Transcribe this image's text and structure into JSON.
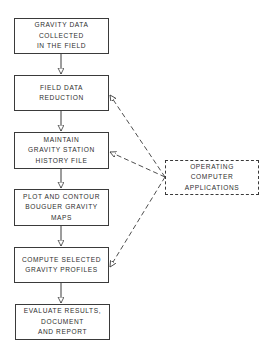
{
  "diagram": {
    "type": "flowchart",
    "steps": [
      {
        "id": "step1",
        "lines": [
          "GRAVITY DATA",
          "COLLECTED",
          "IN THE FIELD"
        ]
      },
      {
        "id": "step2",
        "lines": [
          "FIELD DATA",
          "REDUCTION"
        ]
      },
      {
        "id": "step3",
        "lines": [
          "MAINTAIN",
          "GRAVITY STATION",
          "HISTORY FILE"
        ]
      },
      {
        "id": "step4",
        "lines": [
          "PLOT AND CONTOUR",
          "BOUGUER GRAVITY",
          "MAPS"
        ]
      },
      {
        "id": "step5",
        "lines": [
          "COMPUTE SELECTED",
          "GRAVITY PROFILES"
        ]
      },
      {
        "id": "step6",
        "lines": [
          "EVALUATE RESULTS,",
          "DOCUMENT",
          "AND REPORT"
        ]
      }
    ],
    "support": {
      "id": "operating",
      "lines": [
        "OPERATING",
        "COMPUTER",
        "APPLICATIONS"
      ],
      "style": "dashed",
      "connects_to": [
        "step2",
        "step3",
        "step5"
      ]
    },
    "flow": [
      [
        "step1",
        "step2"
      ],
      [
        "step2",
        "step3"
      ],
      [
        "step3",
        "step4"
      ],
      [
        "step4",
        "step5"
      ],
      [
        "step5",
        "step6"
      ]
    ],
    "colors": {
      "line": "#3a3a3a",
      "text": "#2e2e2e",
      "background": "#ffffff"
    }
  }
}
